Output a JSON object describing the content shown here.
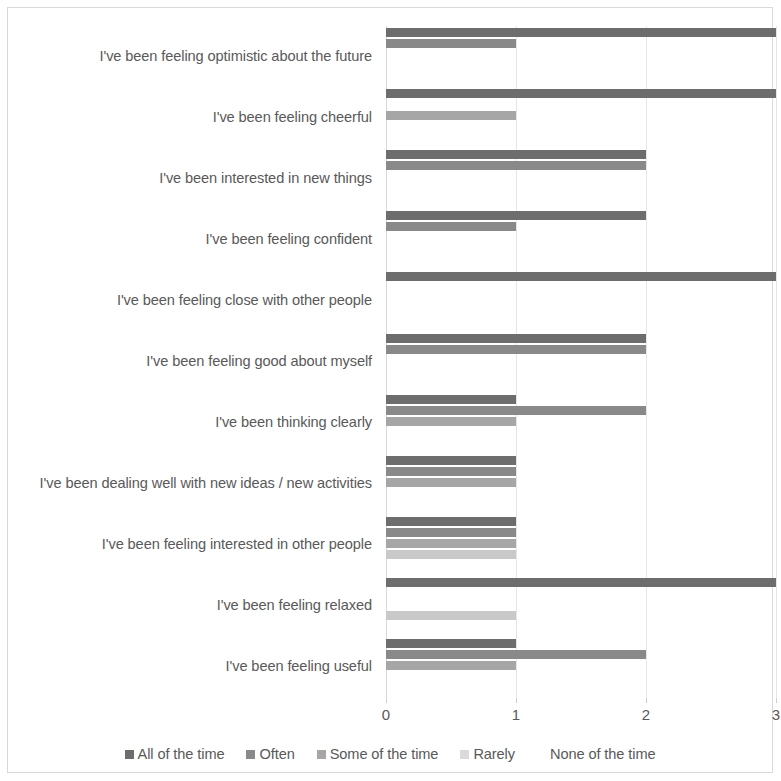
{
  "chart_data": {
    "type": "bar",
    "orientation": "horizontal",
    "grouped": true,
    "title": "",
    "subtitle": "",
    "xlabel": "",
    "ylabel": "",
    "xlim": [
      0,
      3
    ],
    "xticks": [
      0,
      1,
      2,
      3
    ],
    "xtick_labels": [
      "0",
      "1",
      "2",
      "3"
    ],
    "grid": true,
    "grid_axis": "x",
    "legend_position": "bottom",
    "categories": [
      "I've been feeling optimistic about the future",
      "I've been feeling cheerful",
      "I've been interested in new things",
      "I've been feeling confident",
      "I've been feeling close with other people",
      "I've been feeling good about myself",
      "I've been thinking clearly",
      "I've been dealing well with new ideas / new activities",
      "I've been feeling interested in other people",
      "I've been feeling relaxed",
      "I've been feeling useful"
    ],
    "series": [
      {
        "name": "All of the time",
        "color": "#6d6d6d",
        "values": [
          3,
          3,
          2,
          2,
          3,
          2,
          1,
          1,
          1,
          3,
          1
        ]
      },
      {
        "name": "Often",
        "color": "#898989",
        "values": [
          1,
          0,
          2,
          1,
          0,
          2,
          2,
          1,
          1,
          0,
          2
        ]
      },
      {
        "name": "Some of the time",
        "color": "#a6a6a6",
        "values": [
          0,
          1,
          0,
          0,
          0,
          0,
          1,
          1,
          1,
          0,
          1
        ]
      },
      {
        "name": "Rarely",
        "color": "#c9c9c9",
        "values": [
          0,
          0,
          0,
          0,
          0,
          0,
          0,
          0,
          1,
          1,
          0
        ]
      },
      {
        "name": "None of the time",
        "color": "#ffffff",
        "values": [
          0,
          0,
          0,
          0,
          0,
          0,
          0,
          0,
          0,
          0,
          0
        ]
      }
    ]
  },
  "legend": {
    "items": [
      {
        "label": "All of the time",
        "color": "#6d6d6d"
      },
      {
        "label": "Often",
        "color": "#898989"
      },
      {
        "label": "Some of the time",
        "color": "#a6a6a6"
      },
      {
        "label": "Rarely",
        "color": "#dadada"
      },
      {
        "label": "None of the time",
        "color": "#ffffff"
      }
    ]
  },
  "style": {
    "background": "#ffffff",
    "border_color": "#d9d9d9",
    "gridline_color": "#e6e6e6",
    "text_color": "#595959"
  }
}
